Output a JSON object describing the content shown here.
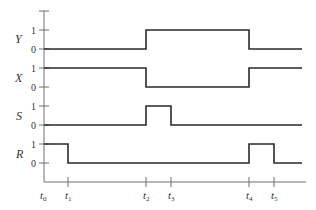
{
  "diagram": {
    "type": "timing-diagram",
    "signals": [
      {
        "name": "Y",
        "levels": [
          "1",
          "0"
        ],
        "waveform": [
          0,
          0,
          1,
          1,
          0,
          0
        ],
        "description": "low until t2, high t2-t4, low after t4"
      },
      {
        "name": "X",
        "levels": [
          "1",
          "0"
        ],
        "waveform": [
          1,
          1,
          0,
          0,
          1,
          1
        ],
        "description": "high until t2, low t2-t4, high after t4"
      },
      {
        "name": "S",
        "levels": [
          "1",
          "0"
        ],
        "waveform": [
          0,
          0,
          1,
          0,
          0,
          0
        ],
        "description": "pulse high from t2 to t3"
      },
      {
        "name": "R",
        "levels": [
          "1",
          "0"
        ],
        "waveform": [
          1,
          0,
          0,
          0,
          1,
          0
        ],
        "description": "high t0-t1, pulse high t4-t5"
      }
    ],
    "time_markers": [
      {
        "label": "t",
        "sub": "0"
      },
      {
        "label": "t",
        "sub": "1"
      },
      {
        "label": "t",
        "sub": "2"
      },
      {
        "label": "t",
        "sub": "3"
      },
      {
        "label": "t",
        "sub": "4"
      },
      {
        "label": "t",
        "sub": "5"
      }
    ],
    "colors": {
      "waveform": "#2a2a2a",
      "axis": "#6e6e6e",
      "text": "#333333"
    }
  }
}
